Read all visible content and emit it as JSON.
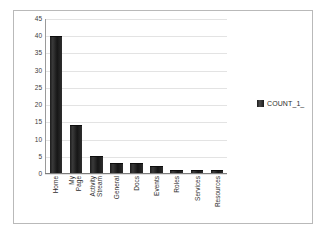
{
  "chart_data": {
    "type": "bar",
    "title": "",
    "xlabel": "",
    "ylabel": "",
    "ylim": [
      0,
      45
    ],
    "ytick_step": 5,
    "yticks": [
      "45",
      "40",
      "35",
      "30",
      "25",
      "20",
      "15",
      "10",
      "5",
      "0"
    ],
    "grid": true,
    "legend_position": "right",
    "categories": [
      "Home",
      "My Page",
      "Activity Stream",
      "General",
      "Docs",
      "Events",
      "Roles",
      "Services",
      "Resources"
    ],
    "category_lines": [
      [
        "Home"
      ],
      [
        "My",
        "Page"
      ],
      [
        "Activity",
        "Stream"
      ],
      [
        "General"
      ],
      [
        "Docs"
      ],
      [
        "Events"
      ],
      [
        "Roles"
      ],
      [
        "Services"
      ],
      [
        "Resources"
      ]
    ],
    "values": [
      40,
      14,
      5,
      3,
      3,
      2,
      1,
      1,
      1
    ],
    "series": [
      {
        "name": "COUNT_1_",
        "values": [
          40,
          14,
          5,
          3,
          3,
          2,
          1,
          1,
          1
        ],
        "color": "#262626"
      }
    ]
  },
  "legend": {
    "entries": [
      {
        "label": "COUNT_1_",
        "color": "#262626"
      }
    ]
  },
  "colors": {
    "bar": "#262626",
    "gridline": "#e3e3e3",
    "axis": "#7d7d7d",
    "frame_border": "#b9b9b9",
    "plot_background": "#ffffff",
    "text": "#2d2d2d"
  }
}
